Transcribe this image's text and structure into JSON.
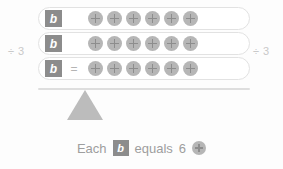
{
  "figure": {
    "title_visible": false,
    "background_color": "#fdfdfd"
  },
  "operators": {
    "left_divide": "÷ 3",
    "right_divide": "÷ 3",
    "equals": "="
  },
  "colors": {
    "tile_fill": "#8c8c8c",
    "tile_text": "#ffffff",
    "counter_fill": "#b6b6b6",
    "counter_plus": "#8d8d8d",
    "capsule_border": "#e2e2e2",
    "beam": "#dedede",
    "fulcrum": "#bcbcbc",
    "muted_text": "#c9c9c9",
    "caption_text": "#9e9e9e"
  },
  "balance": {
    "rows": [
      {
        "variable": "b",
        "show_equals": false,
        "counters": 6
      },
      {
        "variable": "b",
        "show_equals": false,
        "counters": 6
      },
      {
        "variable": "b",
        "show_equals": true,
        "counters": 6
      }
    ]
  },
  "caption": {
    "word_each": "Each",
    "variable": "b",
    "word_equals": "equals",
    "number": "6"
  },
  "chart_data": {
    "type": "diagram",
    "model": "balance-scale",
    "left_side": {
      "item": "b",
      "count": 3
    },
    "right_side": {
      "item": "unit-counter",
      "count": 18,
      "per_row": 6
    },
    "operation": "÷ 3",
    "solution": {
      "variable": "b",
      "value": 6,
      "unit": "unit-counter"
    },
    "annotations": [
      "÷ 3",
      "÷ 3",
      "=",
      "Each b equals 6"
    ]
  }
}
